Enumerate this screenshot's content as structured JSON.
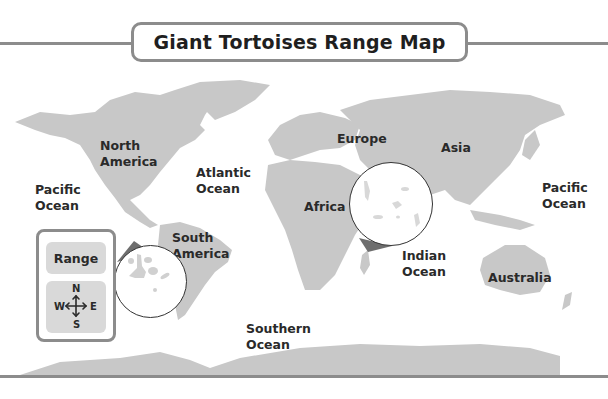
{
  "title": "Giant Tortoises Range Map",
  "colors": {
    "land": "#c8c8c8",
    "frame": "#8c8c8c",
    "range_pointer": "#6e6e6e",
    "text": "#2a2a2a"
  },
  "labels": {
    "north_america": [
      "North",
      "America"
    ],
    "south_america": [
      "South",
      "America"
    ],
    "europe": "Europe",
    "asia": "Asia",
    "africa": "Africa",
    "australia": "Australia",
    "pacific_ocean_west": [
      "Pacific",
      "Ocean"
    ],
    "pacific_ocean_east": [
      "Pacific",
      "Ocean"
    ],
    "atlantic_ocean": [
      "Atlantic",
      "Ocean"
    ],
    "indian_ocean": [
      "Indian",
      "Ocean"
    ],
    "southern_ocean": [
      "Southern",
      "Ocean"
    ]
  },
  "legend": {
    "range_label": "Range",
    "compass": {
      "n": "N",
      "s": "S",
      "e": "E",
      "w": "W"
    }
  },
  "insets": [
    {
      "name": "Galapagos Islands",
      "location": "off west coast of South America"
    },
    {
      "name": "Seychelles / Aldabra",
      "location": "Indian Ocean off east Africa"
    }
  ]
}
